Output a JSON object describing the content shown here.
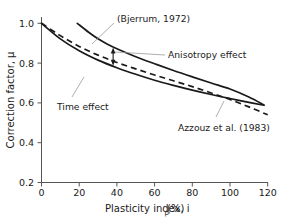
{
  "chart_data": {
    "type": "line",
    "title": "",
    "xlabel": "Plasticity index, i",
    "xlabel_sub": "p",
    "xlabel_unit": " (%)",
    "ylabel": "Correction factor, μ",
    "xlim": [
      0,
      120
    ],
    "ylim": [
      0.2,
      1.0
    ],
    "xticks": [
      0,
      20,
      40,
      60,
      80,
      100,
      120
    ],
    "xtick_labels": [
      "0",
      "20",
      "40",
      "60",
      "80",
      "100",
      "120"
    ],
    "yticks": [
      0.2,
      0.4,
      0.6,
      0.8,
      1.0
    ],
    "ytick_labels": [
      "0.2",
      "0.4",
      "0.6",
      "0.8",
      "1.0"
    ],
    "grid": false,
    "legend_position": "none",
    "series": [
      {
        "name": "Bjerrum (1972) upper",
        "style": "solid",
        "x": [
          19,
          25,
          30,
          35,
          40,
          50,
          60,
          70,
          80,
          90,
          100,
          110,
          118
        ],
        "y": [
          1.0,
          0.955,
          0.922,
          0.895,
          0.872,
          0.832,
          0.797,
          0.763,
          0.731,
          0.7,
          0.67,
          0.63,
          0.59
        ]
      },
      {
        "name": "Bjerrum (1972) lower",
        "style": "solid",
        "x": [
          0,
          10,
          20,
          30,
          40,
          50,
          60,
          70,
          80,
          90,
          100,
          110,
          118
        ],
        "y": [
          1.0,
          0.922,
          0.862,
          0.815,
          0.777,
          0.744,
          0.714,
          0.688,
          0.664,
          0.642,
          0.622,
          0.603,
          0.588
        ]
      },
      {
        "name": "Azzouz et al. (1983)",
        "style": "dashed",
        "x": [
          0,
          10,
          20,
          30,
          40,
          50,
          60,
          70,
          80,
          90,
          100,
          110,
          120
        ],
        "y": [
          1.0,
          0.938,
          0.884,
          0.84,
          0.803,
          0.771,
          0.74,
          0.711,
          0.682,
          0.65,
          0.617,
          0.58,
          0.54
        ]
      }
    ],
    "annotations": [
      {
        "name": "bjerrum-annotation",
        "text": "(Bjerrum, 1972)",
        "target_x": 27,
        "target_y": 0.94
      },
      {
        "name": "anisotropy-effect-annotation",
        "text": "Anisotropy effect",
        "target_x": 38,
        "target_y": 0.835
      },
      {
        "name": "time-effect-annotation",
        "text": "Time effect",
        "target_x": 44,
        "target_y": 0.768
      },
      {
        "name": "azzouz-annotation",
        "text": "Azzouz et al. (1983)",
        "target_x": 92,
        "target_y": 0.645
      }
    ],
    "arrow": {
      "name": "anisotropy-effect-arrow",
      "x": 38,
      "y_top": 0.879,
      "y_bottom": 0.787,
      "double_headed": true
    }
  },
  "colors": {
    "curve": "#1a1a1a",
    "axis": "#555555",
    "leader": "#999999",
    "background": "#ffffff"
  }
}
